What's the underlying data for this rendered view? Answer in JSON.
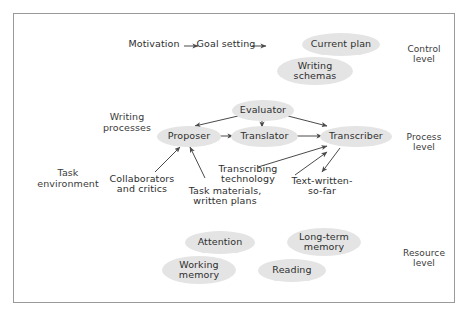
{
  "figure": {
    "background_color": "#ffffff",
    "border_color": "#9a9a9a",
    "node_fill": "#e4e4e4",
    "text_color": "#2e2e2e",
    "arrow_color": "#4a4a4a"
  },
  "control_level": {
    "label": "Control\nlevel",
    "motivation": "Motivation",
    "goal_setting": "Goal setting",
    "current_plan": "Current plan",
    "writing_schemas": "Writing\nschemas"
  },
  "process_level": {
    "label": "Process\nlevel",
    "writing_processes": "Writing\nprocesses",
    "evaluator": "Evaluator",
    "proposer": "Proposer",
    "translator": "Translator",
    "transcriber": "Transcriber"
  },
  "task_environment": {
    "label": "Task\nenvironment",
    "collaborators": "Collaborators\nand critics",
    "task_materials": "Task materials,\nwritten plans",
    "transcribing_technology": "Transcribing\ntechnology",
    "text_written_so_far": "Text-written-\nso-far"
  },
  "resource_level": {
    "label": "Resource\nlevel",
    "attention": "Attention",
    "long_term_memory": "Long-term\nmemory",
    "working_memory": "Working\nmemory",
    "reading": "Reading"
  }
}
